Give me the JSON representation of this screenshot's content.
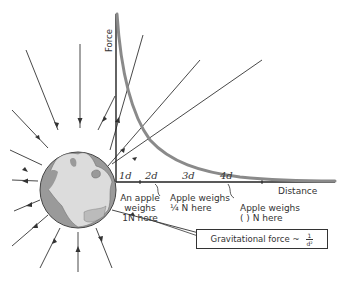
{
  "diagram": {
    "axes": {
      "y_label": "Force",
      "x_label": "Distance",
      "ticks": [
        "1d",
        "2d",
        "3d",
        "4d"
      ]
    },
    "annotations": [
      {
        "id": "apple_1d",
        "lines": [
          "An apple",
          "weighs",
          "1N here"
        ]
      },
      {
        "id": "apple_2d",
        "lines": [
          "Apple weighs",
          "¼ N here"
        ]
      },
      {
        "id": "apple_4d",
        "lines": [
          "Apple weighs",
          "(   ) N here"
        ]
      }
    ],
    "formula": {
      "text": "Gravitational force ~",
      "numerator": "1",
      "denominator": "d²"
    },
    "colors": {
      "curve": "#8a8a8a",
      "axes": "#222222",
      "earth_ocean": "#9a9a9a",
      "earth_land": "#d9d9d9",
      "field_lines": "#333333"
    }
  }
}
